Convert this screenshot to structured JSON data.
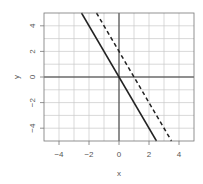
{
  "chart_data": {
    "type": "line",
    "title": "",
    "xlabel": "x",
    "ylabel": "y",
    "xlim": [
      -5,
      5
    ],
    "ylim": [
      -5,
      5
    ],
    "grid": true,
    "x_ticks": [
      -4,
      -2,
      0,
      2,
      4
    ],
    "y_ticks": [
      -4,
      -2,
      0,
      2,
      4
    ],
    "x_tick_labels": [
      "−4",
      "−2",
      "0",
      "2",
      "4"
    ],
    "y_tick_labels": [
      "−4",
      "−2",
      "0",
      "2",
      "4"
    ],
    "series": [
      {
        "name": "solid line",
        "style": "solid",
        "color": "#222222",
        "equation": "y = -2x",
        "x": [
          -2.5,
          2.5
        ],
        "y": [
          5,
          -5
        ]
      },
      {
        "name": "dashed line",
        "style": "dashed",
        "color": "#222222",
        "equation": "y = -2x + 2",
        "x": [
          -1.5,
          3.5
        ],
        "y": [
          5,
          -5
        ]
      }
    ]
  },
  "layout": {
    "plot_left": 44,
    "plot_right": 194,
    "plot_top": 13,
    "plot_bottom": 141
  }
}
